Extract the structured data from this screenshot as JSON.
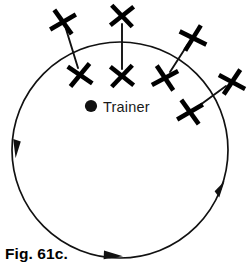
{
  "figure": {
    "caption": "Fig. 61c.",
    "trainer_label": "Trainer",
    "trainer_marker": "filled-circle-dot",
    "stroke_color": "#111111",
    "cone_color": "#000000",
    "background_color": "#ffffff"
  },
  "diagram_data": {
    "type": "diagram",
    "title": "Fig. 61c.",
    "circle": {
      "center": [
        120,
        150
      ],
      "radius": 108,
      "direction": "clockwise",
      "arrow_count": 3,
      "arrow_positions": [
        "left-descending",
        "bottom-rightward",
        "right-ascending"
      ]
    },
    "trainer": {
      "dot_position": [
        91,
        106
      ],
      "label": "Trainer",
      "label_position": [
        103,
        112
      ]
    },
    "cone_pairs": [
      {
        "id": "pair-1",
        "outer": [
          63,
          22
        ],
        "inner": [
          80,
          75
        ],
        "orientation": "diagonal-left"
      },
      {
        "id": "pair-2",
        "outer": [
          122,
          16
        ],
        "inner": [
          122,
          76
        ],
        "orientation": "vertical"
      },
      {
        "id": "pair-3",
        "outer": [
          193,
          38
        ],
        "inner": [
          165,
          78
        ],
        "orientation": "diagonal-right"
      },
      {
        "id": "pair-4",
        "outer": [
          232,
          82
        ],
        "inner": [
          190,
          112
        ],
        "orientation": "diagonal-right"
      }
    ],
    "cone_count": 8,
    "cone_glyph": "X"
  }
}
